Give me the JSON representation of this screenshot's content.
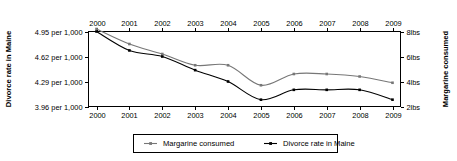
{
  "chart_data": {
    "type": "line",
    "title": "",
    "xlabel": "",
    "grid": false,
    "legend_position": "bottom-center",
    "x": [
      2000,
      2001,
      2002,
      2003,
      2004,
      2005,
      2006,
      2007,
      2008,
      2009
    ],
    "x_tick_labels_top": [
      "2000",
      "2001",
      "2002",
      "2003",
      "2004",
      "2005",
      "2006",
      "2007",
      "2008",
      "2009"
    ],
    "x_tick_labels_bottom": [
      "2000",
      "2001",
      "2002",
      "2003",
      "2004",
      "2005",
      "2006",
      "2007",
      "2008",
      "2009"
    ],
    "axes": {
      "left": {
        "title": "Divorce rate in Maine",
        "tick_labels": [
          "4.95 per 1,000",
          "4.62 per 1,000",
          "4.29 per 1,000",
          "3.96 per 1,000"
        ],
        "tick_values": [
          4.95,
          4.62,
          4.29,
          3.96
        ],
        "ylim": [
          3.96,
          4.95
        ]
      },
      "right": {
        "title": "Margarine consumed",
        "tick_labels": [
          "8lbs",
          "6lbs",
          "4lbs",
          "2lbs"
        ],
        "tick_values": [
          8,
          6,
          4,
          2
        ],
        "ylim": [
          2,
          8
        ]
      }
    },
    "series": [
      {
        "name": "Margarine consumed",
        "axis": "right",
        "color": "#777777",
        "unit": "lbs",
        "values": [
          8.2,
          7.0,
          6.2,
          5.3,
          5.3,
          3.7,
          4.6,
          4.6,
          4.4,
          3.9
        ]
      },
      {
        "name": "Divorce rate in Maine",
        "axis": "left",
        "color": "#000000",
        "unit": "per 1,000",
        "values": [
          4.95,
          4.7,
          4.62,
          4.44,
          4.29,
          4.05,
          4.18,
          4.18,
          4.18,
          4.05
        ]
      }
    ],
    "legend": [
      {
        "label": "Margarine consumed",
        "color": "#777777"
      },
      {
        "label": "Divorce rate in Maine",
        "color": "#000000"
      }
    ]
  }
}
